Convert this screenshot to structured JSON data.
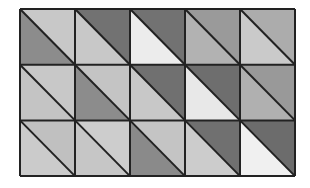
{
  "diagram": {
    "type": "triangle-grid",
    "rows": 3,
    "cols": 5,
    "origin": {
      "x": 20,
      "y": 9
    },
    "cell_width": 55,
    "cell_height": 55.7,
    "diagonal": "top-left-to-bottom-right",
    "line_color": "#222222",
    "line_width": 2,
    "cells": [
      [
        {
          "upper_right": "#c8c8c8",
          "lower_left": "#8c8c8c"
        },
        {
          "upper_right": "#727272",
          "lower_left": "#c8c8c8"
        },
        {
          "upper_right": "#727272",
          "lower_left": "#ececec"
        },
        {
          "upper_right": "#9a9a9a",
          "lower_left": "#b2b2b2"
        },
        {
          "upper_right": "#acacac",
          "lower_left": "#cacaca"
        }
      ],
      [
        {
          "upper_right": "#c8c8c8",
          "lower_left": "#c4c4c4"
        },
        {
          "upper_right": "#c4c4c4",
          "lower_left": "#8c8c8c"
        },
        {
          "upper_right": "#707070",
          "lower_left": "#c8c8c8"
        },
        {
          "upper_right": "#6e6e6e",
          "lower_left": "#e8e8e8"
        },
        {
          "upper_right": "#999999",
          "lower_left": "#b0b0b0"
        }
      ],
      [
        {
          "upper_right": "#c0c0c0",
          "lower_left": "#cbcbcb"
        },
        {
          "upper_right": "#cdcdcd",
          "lower_left": "#c6c6c6"
        },
        {
          "upper_right": "#c4c4c4",
          "lower_left": "#8a8a8a"
        },
        {
          "upper_right": "#707070",
          "lower_left": "#cccccc"
        },
        {
          "upper_right": "#6c6c6c",
          "lower_left": "#f0f0f0"
        }
      ]
    ]
  }
}
